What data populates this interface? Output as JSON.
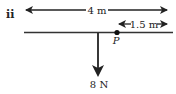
{
  "diagram": {
    "part_label": "ii",
    "total_length_label": "4 m",
    "offset_label": "1.5 m",
    "point_label": "P",
    "force_label": "8 N",
    "colors": {
      "ink": "#222222",
      "background": "#ffffff"
    }
  }
}
